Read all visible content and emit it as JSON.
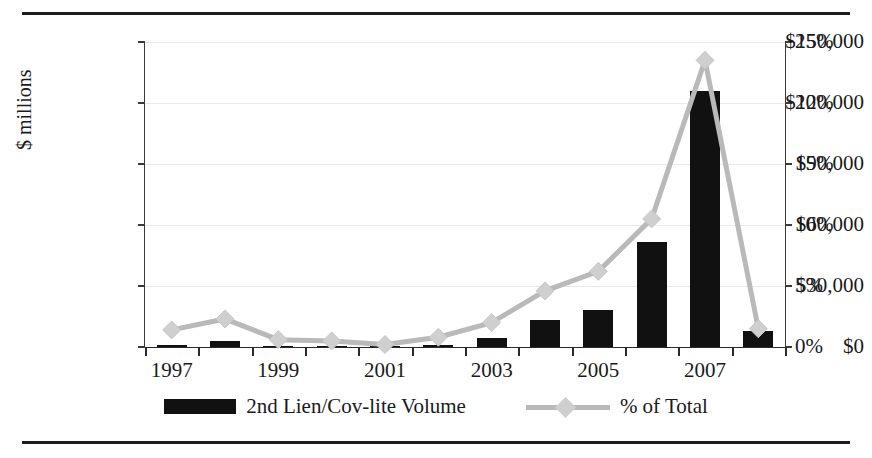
{
  "chart_data": {
    "type": "bar",
    "title": "",
    "xlabel": "",
    "ylabel": "$ millions",
    "ylabel_right": "",
    "categories": [
      "1997",
      "1998",
      "1999",
      "2000",
      "2001",
      "2002",
      "2003",
      "2004",
      "2005",
      "2006",
      "2007",
      "2008"
    ],
    "x_tick_labels": [
      "1997",
      "",
      "1999",
      "",
      "2001",
      "",
      "2003",
      "",
      "2005",
      "",
      "2007",
      ""
    ],
    "ylim": [
      0,
      150000
    ],
    "y_ticks": [
      0,
      30000,
      60000,
      90000,
      120000,
      150000
    ],
    "y_tick_labels": [
      "$0",
      "$30,000",
      "$60,000",
      "$90,000",
      "$120,000",
      "$150,000"
    ],
    "ylim_right": [
      0,
      25
    ],
    "y_ticks_right": [
      0,
      5,
      10,
      15,
      20,
      25
    ],
    "y_tick_labels_right": [
      "0%",
      "5%",
      "10%",
      "15%",
      "20%",
      "25%"
    ],
    "grid": true,
    "legend_position": "bottom",
    "series": [
      {
        "name": "2nd Lien/Cov-lite Volume",
        "type": "bar",
        "axis": "left",
        "color": "#111111",
        "values": [
          1200,
          2800,
          600,
          500,
          300,
          900,
          4200,
          13300,
          18300,
          51600,
          126000,
          8000
        ]
      },
      {
        "name": "% of Total",
        "type": "line",
        "axis": "right",
        "color": "#b9b9b9",
        "marker": "diamond",
        "values": [
          1.4,
          2.3,
          0.6,
          0.5,
          0.2,
          0.8,
          2.0,
          4.6,
          6.2,
          10.5,
          23.5,
          1.5
        ]
      }
    ]
  },
  "legend": {
    "items": [
      {
        "label": "2nd Lien/Cov-lite Volume",
        "swatch": "bar-swatch"
      },
      {
        "label": "% of Total",
        "swatch": "line-diamond-swatch"
      }
    ]
  },
  "colors": {
    "bar": "#111111",
    "line": "#b9b9b9",
    "marker": "#cfcfcf",
    "grid": "#e9e9ec",
    "axis": "#3a3a3a",
    "rule": "#1c1c1c"
  }
}
